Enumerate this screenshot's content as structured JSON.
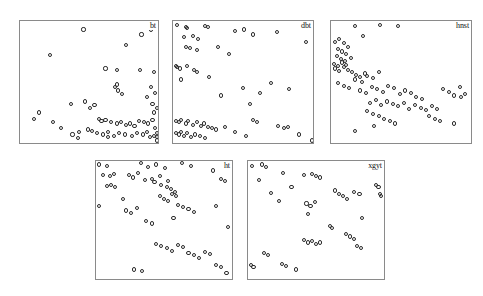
{
  "figure": {
    "type": "scatter-matrix",
    "background": "#ffffff",
    "marker_color": "#2b2b2b",
    "border_color": "#8a8a8a",
    "width": 483,
    "height": 296
  },
  "chart_data": {
    "type": "scatter",
    "title": "",
    "xlabel": "",
    "ylabel": "",
    "grid": false,
    "legend": "none",
    "layout": "5 panels: 3 across top row, 2 across bottom row",
    "marker": "open circle",
    "xlim": [
      0,
      1
    ],
    "ylim": [
      0,
      1
    ],
    "panels": [
      {
        "label": "bt",
        "label_position": "top-right",
        "rect": {
          "x": 19,
          "y": 20,
          "w": 140,
          "h": 124
        },
        "n_points": 62,
        "x": [
          0.46,
          0.88,
          0.77,
          0.95,
          0.22,
          0.62,
          0.7,
          0.87,
          0.97,
          0.7,
          0.69,
          0.71,
          0.74,
          0.95,
          0.98,
          0.92,
          0.14,
          0.37,
          0.47,
          0.54,
          0.51,
          0.96,
          0.99,
          0.97,
          0.24,
          0.57,
          0.59,
          0.62,
          0.66,
          0.7,
          0.73,
          0.77,
          0.8,
          0.83,
          0.86,
          0.9,
          0.93,
          0.96,
          0.98,
          0.99,
          0.1,
          0.3,
          0.43,
          0.49,
          0.52,
          0.56,
          0.6,
          0.64,
          0.68,
          0.72,
          0.76,
          0.81,
          0.85,
          0.89,
          0.92,
          0.94,
          0.97,
          0.99,
          0.99,
          0.38,
          0.42,
          0.64
        ],
        "y": [
          0.93,
          0.89,
          0.8,
          0.93,
          0.72,
          0.61,
          0.6,
          0.6,
          0.58,
          0.48,
          0.46,
          0.43,
          0.4,
          0.46,
          0.41,
          0.38,
          0.25,
          0.32,
          0.34,
          0.31,
          0.29,
          0.32,
          0.29,
          0.25,
          0.17,
          0.2,
          0.18,
          0.19,
          0.17,
          0.16,
          0.17,
          0.15,
          0.16,
          0.14,
          0.18,
          0.17,
          0.16,
          0.19,
          0.12,
          0.08,
          0.2,
          0.12,
          0.09,
          0.11,
          0.1,
          0.08,
          0.07,
          0.09,
          0.06,
          0.08,
          0.07,
          0.06,
          0.08,
          0.07,
          0.09,
          0.05,
          0.06,
          0.05,
          0.02,
          0.07,
          0.04,
          0.05
        ],
        "pattern": "points concentrated toward bottom-right corner, sparse upper-left"
      },
      {
        "label": "dbt",
        "label_position": "top-right",
        "rect": {
          "x": 172,
          "y": 20,
          "w": 142,
          "h": 124
        },
        "n_points": 63,
        "x": [
          0.03,
          0.09,
          0.1,
          0.23,
          0.25,
          0.44,
          0.51,
          0.57,
          0.74,
          0.95,
          0.08,
          0.14,
          0.18,
          0.09,
          0.12,
          0.17,
          0.32,
          0.4,
          0.02,
          0.03,
          0.05,
          0.1,
          0.15,
          0.17,
          0.06,
          0.26,
          0.5,
          0.62,
          0.7,
          0.83,
          0.34,
          0.55,
          0.02,
          0.04,
          0.06,
          0.09,
          0.11,
          0.14,
          0.17,
          0.2,
          0.22,
          0.25,
          0.28,
          0.31,
          0.02,
          0.04,
          0.06,
          0.08,
          0.1,
          0.13,
          0.16,
          0.19,
          0.23,
          0.37,
          0.44,
          0.52,
          0.57,
          0.6,
          0.75,
          0.79,
          0.82,
          0.9,
          0.99
        ],
        "y": [
          0.97,
          0.95,
          0.94,
          0.96,
          0.95,
          0.92,
          0.93,
          0.89,
          0.91,
          0.83,
          0.87,
          0.88,
          0.85,
          0.79,
          0.78,
          0.76,
          0.79,
          0.73,
          0.63,
          0.62,
          0.61,
          0.63,
          0.6,
          0.58,
          0.52,
          0.54,
          0.45,
          0.41,
          0.49,
          0.44,
          0.39,
          0.32,
          0.18,
          0.17,
          0.19,
          0.16,
          0.18,
          0.15,
          0.17,
          0.14,
          0.16,
          0.13,
          0.12,
          0.11,
          0.08,
          0.07,
          0.09,
          0.06,
          0.08,
          0.05,
          0.07,
          0.06,
          0.04,
          0.13,
          0.09,
          0.06,
          0.19,
          0.17,
          0.14,
          0.12,
          0.13,
          0.07,
          0.02
        ],
        "pattern": "dense along left edge and bottom-left, diffuse elsewhere"
      },
      {
        "label": "hnst",
        "label_position": "top-right",
        "rect": {
          "x": 330,
          "y": 20,
          "w": 142,
          "h": 124
        },
        "n_points": 78,
        "x": [
          0.17,
          0.35,
          0.48,
          0.23,
          0.03,
          0.06,
          0.09,
          0.12,
          0.05,
          0.08,
          0.11,
          0.04,
          0.07,
          0.1,
          0.02,
          0.05,
          0.08,
          0.11,
          0.14,
          0.03,
          0.06,
          0.09,
          0.12,
          0.15,
          0.18,
          0.21,
          0.24,
          0.05,
          0.09,
          0.13,
          0.17,
          0.22,
          0.26,
          0.3,
          0.34,
          0.21,
          0.25,
          0.29,
          0.33,
          0.37,
          0.41,
          0.45,
          0.49,
          0.53,
          0.57,
          0.61,
          0.65,
          0.28,
          0.32,
          0.36,
          0.4,
          0.44,
          0.48,
          0.52,
          0.56,
          0.6,
          0.64,
          0.68,
          0.72,
          0.76,
          0.8,
          0.84,
          0.88,
          0.92,
          0.96,
          0.3,
          0.34,
          0.38,
          0.42,
          0.46,
          0.26,
          0.31,
          0.7,
          0.74,
          0.78,
          0.88,
          0.93,
          0.17
        ],
        "y": [
          0.96,
          0.97,
          0.96,
          0.88,
          0.83,
          0.85,
          0.82,
          0.79,
          0.77,
          0.75,
          0.73,
          0.71,
          0.69,
          0.67,
          0.65,
          0.63,
          0.66,
          0.64,
          0.7,
          0.61,
          0.59,
          0.62,
          0.6,
          0.58,
          0.56,
          0.54,
          0.57,
          0.49,
          0.47,
          0.45,
          0.52,
          0.5,
          0.55,
          0.53,
          0.58,
          0.43,
          0.41,
          0.46,
          0.44,
          0.42,
          0.47,
          0.45,
          0.4,
          0.43,
          0.41,
          0.38,
          0.36,
          0.33,
          0.35,
          0.31,
          0.34,
          0.32,
          0.3,
          0.33,
          0.28,
          0.31,
          0.29,
          0.27,
          0.3,
          0.28,
          0.44,
          0.42,
          0.39,
          0.46,
          0.4,
          0.24,
          0.22,
          0.2,
          0.18,
          0.16,
          0.26,
          0.14,
          0.22,
          0.2,
          0.18,
          0.16,
          0.38,
          0.1
        ],
        "pattern": "tight cluster at upper-left, diagonal spread down-right"
      },
      {
        "label": "ht",
        "label_position": "top-right",
        "rect": {
          "x": 95,
          "y": 160,
          "w": 138,
          "h": 120
        },
        "n_points": 64,
        "x": [
          0.02,
          0.08,
          0.33,
          0.38,
          0.44,
          0.51,
          0.63,
          0.7,
          0.05,
          0.1,
          0.13,
          0.24,
          0.27,
          0.31,
          0.41,
          0.47,
          0.53,
          0.08,
          0.11,
          0.14,
          0.36,
          0.43,
          0.48,
          0.52,
          0.55,
          0.58,
          0.86,
          0.92,
          0.95,
          0.2,
          0.47,
          0.5,
          0.53,
          0.56,
          0.59,
          0.02,
          0.22,
          0.26,
          0.3,
          0.6,
          0.64,
          0.68,
          0.72,
          0.88,
          0.37,
          0.41,
          0.57,
          0.97,
          0.44,
          0.48,
          0.52,
          0.56,
          0.6,
          0.64,
          0.68,
          0.72,
          0.76,
          0.8,
          0.84,
          0.88,
          0.92,
          0.96,
          0.28,
          0.34
        ],
        "y": [
          0.97,
          0.96,
          0.98,
          0.95,
          0.97,
          0.94,
          0.98,
          0.96,
          0.88,
          0.87,
          0.89,
          0.88,
          0.86,
          0.9,
          0.85,
          0.87,
          0.83,
          0.79,
          0.8,
          0.78,
          0.84,
          0.82,
          0.8,
          0.78,
          0.76,
          0.74,
          0.92,
          0.85,
          0.83,
          0.68,
          0.7,
          0.68,
          0.66,
          0.72,
          0.7,
          0.62,
          0.58,
          0.56,
          0.6,
          0.63,
          0.61,
          0.59,
          0.57,
          0.62,
          0.49,
          0.47,
          0.52,
          0.44,
          0.3,
          0.28,
          0.26,
          0.24,
          0.29,
          0.27,
          0.22,
          0.2,
          0.18,
          0.23,
          0.21,
          0.12,
          0.1,
          0.05,
          0.08,
          0.07
        ],
        "pattern": "upper half denser with mid-panel cluster, lower-right scattered band"
      },
      {
        "label": "xgyt",
        "label_position": "top-right",
        "rect": {
          "x": 247,
          "y": 160,
          "w": 138,
          "h": 120
        },
        "n_points": 46,
        "x": [
          0.03,
          0.1,
          0.13,
          0.08,
          0.26,
          0.32,
          0.41,
          0.47,
          0.5,
          0.53,
          0.17,
          0.23,
          0.43,
          0.46,
          0.49,
          0.44,
          0.64,
          0.67,
          0.7,
          0.73,
          0.78,
          0.82,
          0.94,
          0.96,
          0.97,
          0.98,
          0.84,
          0.6,
          0.62,
          0.72,
          0.75,
          0.78,
          0.41,
          0.44,
          0.47,
          0.5,
          0.53,
          0.8,
          0.83,
          0.12,
          0.15,
          0.02,
          0.04,
          0.25,
          0.28,
          0.35
        ],
        "y": [
          0.96,
          0.97,
          0.95,
          0.84,
          0.9,
          0.78,
          0.88,
          0.89,
          0.87,
          0.86,
          0.73,
          0.66,
          0.64,
          0.62,
          0.65,
          0.55,
          0.75,
          0.72,
          0.7,
          0.68,
          0.74,
          0.72,
          0.8,
          0.78,
          0.72,
          0.7,
          0.52,
          0.45,
          0.43,
          0.38,
          0.36,
          0.34,
          0.33,
          0.31,
          0.32,
          0.3,
          0.31,
          0.28,
          0.26,
          0.22,
          0.2,
          0.12,
          0.1,
          0.13,
          0.11,
          0.08
        ],
        "pattern": "sparse, roughly uniform with a few tight pairs"
      }
    ]
  }
}
